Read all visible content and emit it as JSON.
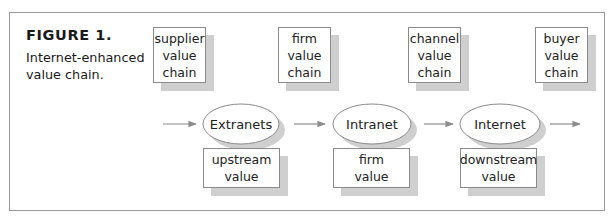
{
  "figure": {
    "title": "FIGURE 1.",
    "caption_lines": [
      "Internet-enhanced",
      "value chain."
    ]
  },
  "top_boxes": [
    {
      "id": "supplier",
      "lines": [
        "supplier",
        "value",
        "chain"
      ]
    },
    {
      "id": "firm",
      "lines": [
        "firm",
        "value",
        "chain"
      ]
    },
    {
      "id": "channel",
      "lines": [
        "channel",
        "value",
        "chain"
      ]
    },
    {
      "id": "buyer",
      "lines": [
        "buyer",
        "value",
        "chain"
      ]
    }
  ],
  "networks": [
    {
      "id": "extranets",
      "label": "Extranets"
    },
    {
      "id": "intranet",
      "label": "Intranet"
    },
    {
      "id": "internet",
      "label": "Internet"
    }
  ],
  "bottom_boxes": [
    {
      "id": "upstream",
      "lines": [
        "upstream",
        "value"
      ]
    },
    {
      "id": "firm-value",
      "lines": [
        "firm",
        "value"
      ]
    },
    {
      "id": "downstream",
      "lines": [
        "downstream",
        "value"
      ]
    }
  ],
  "flow_arrows": 4,
  "colors": {
    "frame": "#9a9a9a",
    "shadow": "#cfcfcf",
    "arrow": "#8c8c8c",
    "text": "#1a1a1a"
  }
}
